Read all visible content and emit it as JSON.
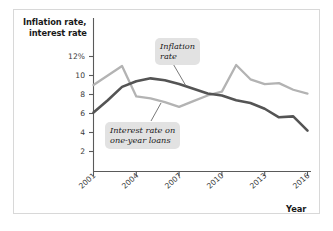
{
  "figure": {
    "y_axis_title_line1": "Inflation rate,",
    "y_axis_title_line2": "interest rate",
    "x_axis_title": "Year"
  },
  "annotations": {
    "inflation": {
      "line1": "Inflation",
      "line2": "rate"
    },
    "interest": {
      "line1": "Interest rate on",
      "line2": "one-year loans"
    }
  },
  "colors": {
    "inflation_line": "#b3b3b3",
    "interest_line": "#545454",
    "axis": "#5a5a5a",
    "frame": "#d8d8d8",
    "callout_bg": "#e2e2e2",
    "text": "#1a1a1a"
  },
  "chart_data": {
    "type": "line",
    "title": "",
    "xlabel": "Year",
    "ylabel": "Inflation rate, interest rate",
    "xlim": [
      2001,
      2016
    ],
    "ylim": [
      0,
      13
    ],
    "grid": false,
    "legend": "annotated-callouts",
    "y_tick_labels": [
      "12%",
      "10",
      "8",
      "6",
      "4",
      "2"
    ],
    "y_tick_values": [
      12,
      10,
      8,
      6,
      4,
      2
    ],
    "x_tick_labels": [
      "2001",
      "2004",
      "2007",
      "2010",
      "2013",
      "2016"
    ],
    "x_tick_values": [
      2001,
      2004,
      2007,
      2010,
      2013,
      2016
    ],
    "x": [
      2001,
      2002,
      2003,
      2004,
      2005,
      2006,
      2007,
      2008,
      2009,
      2010,
      2011,
      2012,
      2013,
      2014,
      2015,
      2016
    ],
    "series": [
      {
        "name": "Inflation rate",
        "color": "#b3b3b3",
        "values": [
          9.0,
          10.0,
          11.0,
          7.8,
          7.6,
          7.2,
          6.7,
          7.3,
          7.9,
          8.3,
          11.1,
          9.6,
          9.1,
          9.2,
          8.5,
          8.1
        ]
      },
      {
        "name": "Interest rate on one-year loans",
        "color": "#545454",
        "values": [
          6.1,
          7.4,
          8.8,
          9.4,
          9.7,
          9.5,
          9.1,
          8.6,
          8.1,
          7.9,
          7.4,
          7.1,
          6.5,
          5.6,
          5.7,
          4.2
        ]
      }
    ]
  }
}
